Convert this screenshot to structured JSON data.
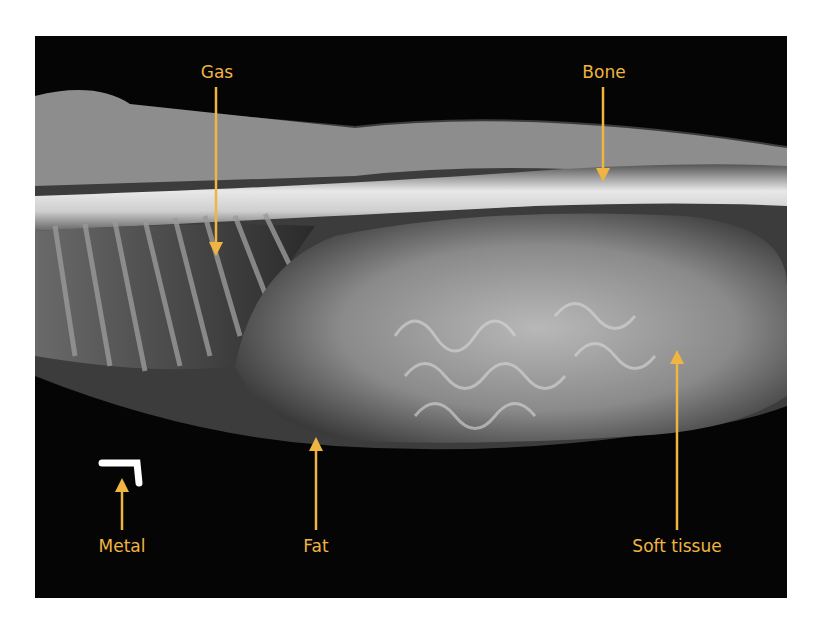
{
  "figure": {
    "accent_color": "#f0b442",
    "labels": [
      {
        "id": "gas",
        "text": "Gas"
      },
      {
        "id": "bone",
        "text": "Bone"
      },
      {
        "id": "metal",
        "text": "Metal"
      },
      {
        "id": "fat",
        "text": "Fat"
      },
      {
        "id": "soft_tissue",
        "text": "Soft tissue"
      }
    ]
  }
}
